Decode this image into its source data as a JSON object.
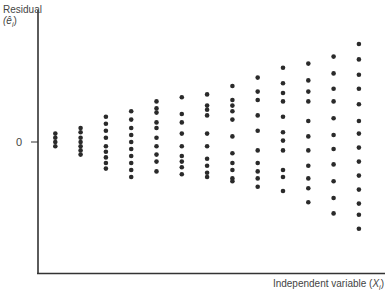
{
  "chart_data": {
    "type": "scatter",
    "title": "",
    "xlabel": "Independent variable (X_i)",
    "ylabel": "Residual (ê_i)",
    "y_ticks": [
      "0"
    ],
    "x_ticks": [],
    "grid": false,
    "legend": null,
    "columns": [
      {
        "x": 1,
        "residuals": [
          0.6,
          0.3,
          0.0,
          -0.3
        ]
      },
      {
        "x": 2,
        "residuals": [
          1.0,
          0.7,
          0.3,
          0.0,
          -0.3,
          -0.6,
          -0.9
        ]
      },
      {
        "x": 3,
        "residuals": [
          1.8,
          1.3,
          0.8,
          0.3,
          -0.3,
          -0.7,
          -1.1,
          -1.5,
          -1.9
        ]
      },
      {
        "x": 4,
        "residuals": [
          2.2,
          1.6,
          1.0,
          0.5,
          0.0,
          -0.5,
          -1.0,
          -1.5,
          -2.0,
          -2.5
        ]
      },
      {
        "x": 5,
        "residuals": [
          2.9,
          2.4,
          2.1,
          1.4,
          1.0,
          0.3,
          -0.3,
          -0.9,
          -1.4,
          -2.1
        ]
      },
      {
        "x": 6,
        "residuals": [
          3.2,
          2.0,
          1.4,
          0.6,
          -0.3,
          -1.0,
          -1.4,
          -1.8,
          -2.3
        ]
      },
      {
        "x": 7,
        "residuals": [
          3.4,
          2.6,
          2.3,
          1.9,
          0.6,
          -0.3,
          -1.2,
          -1.7,
          -2.2,
          -2.5
        ]
      },
      {
        "x": 8,
        "residuals": [
          4.0,
          3.0,
          2.6,
          2.2,
          1.6,
          0.4,
          -0.8,
          -1.5,
          -2.0,
          -2.6,
          -2.8
        ]
      },
      {
        "x": 9,
        "residuals": [
          4.6,
          3.6,
          3.0,
          1.9,
          0.8,
          -0.6,
          -1.5,
          -2.1,
          -2.6,
          -3.2
        ]
      },
      {
        "x": 10,
        "residuals": [
          5.3,
          4.2,
          3.5,
          2.9,
          1.8,
          0.7,
          0.1,
          -0.6,
          -2.0,
          -2.5,
          -3.5
        ]
      },
      {
        "x": 11,
        "residuals": [
          5.6,
          4.4,
          3.6,
          2.9,
          1.5,
          0.4,
          -0.6,
          -1.7,
          -2.6,
          -3.3,
          -4.3
        ]
      },
      {
        "x": 12,
        "residuals": [
          6.1,
          4.9,
          3.8,
          2.9,
          1.7,
          0.5,
          -0.5,
          -1.6,
          -2.8,
          -4.0,
          -5.1
        ]
      },
      {
        "x": 13,
        "residuals": [
          7.0,
          5.9,
          4.8,
          3.8,
          2.7,
          1.5,
          0.6,
          -0.4,
          -1.4,
          -2.4,
          -3.4,
          -4.4,
          -5.2,
          -6.2
        ]
      }
    ],
    "xlim": [
      0,
      13.5
    ],
    "ylim": [
      -9.5,
      7.8
    ]
  },
  "labels": {
    "ylabel_line1": "Residual",
    "ylabel_line2": "(ê",
    "ylabel_sub": "i",
    "ylabel_close": ")",
    "xlabel_text": "Independent variable (",
    "xlabel_var": "X",
    "xlabel_sub": "i",
    "xlabel_close": ")",
    "zero_tick": "0"
  },
  "style": {
    "axis_color": "#333333",
    "point_color": "#2a2a2a"
  }
}
